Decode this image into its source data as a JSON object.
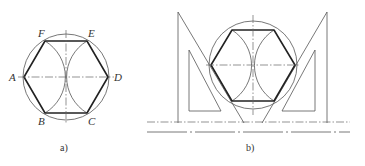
{
  "figure_a": {
    "caption": "a)",
    "labels": {
      "A": "A",
      "B": "B",
      "C": "C",
      "D": "D",
      "E": "E",
      "F": "F"
    },
    "description": "Regular hexagon inscribed in a circle using compass arcs of radius R centered at A and D"
  },
  "figure_b": {
    "caption": "b)",
    "description": "Regular hexagon inscribed in a circle constructed using a T-square and 30-60 set squares"
  },
  "colors": {
    "line": "#555555",
    "thick_line": "#222222",
    "text": "#333333",
    "background": "#ffffff"
  }
}
